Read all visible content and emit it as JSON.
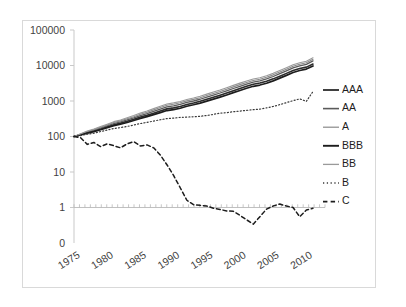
{
  "chart_data": {
    "type": "line",
    "title": "",
    "xlabel": "",
    "ylabel": "",
    "yscale": "log",
    "ylim": [
      0.3,
      100000
    ],
    "xlim": [
      1974,
      2010
    ],
    "grid": false,
    "legend_position": "right",
    "y_tick_labels": [
      "100000",
      "10000",
      "1000",
      "100",
      "10",
      "1",
      "0"
    ],
    "y_tick_values": [
      100000,
      10000,
      1000,
      100,
      10,
      1,
      0
    ],
    "x_tick_labels": [
      "1975",
      "1980",
      "1985",
      "1990",
      "1995",
      "2000",
      "2005",
      "2010"
    ],
    "x_tick_values": [
      1975,
      1980,
      1985,
      1990,
      1995,
      2000,
      2005,
      2010
    ],
    "x": [
      1974,
      1975,
      1976,
      1977,
      1978,
      1979,
      1980,
      1981,
      1982,
      1983,
      1984,
      1985,
      1986,
      1987,
      1988,
      1989,
      1990,
      1991,
      1992,
      1993,
      1994,
      1995,
      1996,
      1997,
      1998,
      1999,
      2000,
      2001,
      2002,
      2003,
      2004,
      2005,
      2006,
      2007,
      2008,
      2009,
      2010
    ],
    "series": [
      {
        "name": "AAA",
        "style": "solid",
        "color": "#2b2b2b",
        "width": 1.6,
        "values": [
          100,
          112,
          128,
          143,
          163,
          188,
          215,
          238,
          268,
          305,
          352,
          398,
          455,
          521,
          600,
          640,
          700,
          800,
          880,
          980,
          1120,
          1280,
          1460,
          1680,
          1950,
          2250,
          2600,
          2950,
          3200,
          3600,
          4200,
          5000,
          6000,
          7200,
          8200,
          9000,
          11000
        ]
      },
      {
        "name": "AA",
        "style": "solid",
        "color": "#5a5a5a",
        "width": 1.3,
        "values": [
          100,
          115,
          133,
          150,
          172,
          200,
          232,
          258,
          292,
          335,
          390,
          442,
          510,
          590,
          680,
          730,
          800,
          910,
          1000,
          1120,
          1280,
          1470,
          1680,
          1940,
          2250,
          2600,
          3000,
          3400,
          3700,
          4200,
          4900,
          5900,
          7100,
          8600,
          9800,
          10800,
          13500
        ]
      },
      {
        "name": "A",
        "style": "solid",
        "color": "#8a8a8a",
        "width": 1.1,
        "values": [
          100,
          118,
          138,
          157,
          182,
          212,
          248,
          276,
          315,
          362,
          424,
          484,
          562,
          652,
          756,
          812,
          890,
          1010,
          1110,
          1240,
          1420,
          1630,
          1860,
          2150,
          2500,
          2890,
          3330,
          3780,
          4100,
          4650,
          5450,
          6550,
          7900,
          9500,
          10900,
          12000,
          15000
        ]
      },
      {
        "name": "BBB",
        "style": "solid",
        "color": "#1d1d1d",
        "width": 1.7,
        "values": [
          100,
          110,
          124,
          137,
          155,
          178,
          202,
          222,
          248,
          282,
          324,
          364,
          414,
          470,
          538,
          574,
          626,
          712,
          782,
          870,
          992,
          1130,
          1288,
          1480,
          1716,
          1980,
          2288,
          2596,
          2816,
          3168,
          3696,
          4400,
          5280,
          6336,
          7216,
          7920,
          9680
        ]
      },
      {
        "name": "BB",
        "style": "solid",
        "color": "#9a9a9a",
        "width": 1.1,
        "values": [
          100,
          120,
          142,
          163,
          190,
          222,
          262,
          292,
          336,
          388,
          456,
          524,
          610,
          710,
          824,
          886,
          972,
          1104,
          1216,
          1360,
          1560,
          1792,
          2048,
          2368,
          2752,
          3184,
          3672,
          4168,
          4520,
          5128,
          6008,
          7216,
          8704,
          10472,
          12008,
          13216,
          16500
        ]
      },
      {
        "name": "B",
        "style": "dotted",
        "color": "#3a3a3a",
        "width": 1.2,
        "values": [
          100,
          106,
          116,
          124,
          138,
          152,
          168,
          178,
          192,
          210,
          232,
          250,
          272,
          296,
          320,
          330,
          345,
          352,
          360,
          372,
          390,
          420,
          455,
          470,
          500,
          520,
          545,
          570,
          590,
          640,
          700,
          790,
          900,
          1020,
          1150,
          980,
          1850
        ]
      },
      {
        "name": "C",
        "style": "dashed",
        "color": "#1d1d1d",
        "width": 1.5,
        "values": [
          100,
          92,
          60,
          68,
          52,
          62,
          55,
          48,
          62,
          72,
          54,
          58,
          48,
          30,
          16,
          8,
          3.6,
          1.6,
          1.2,
          1.15,
          1.1,
          0.95,
          0.88,
          0.8,
          0.78,
          0.6,
          0.45,
          0.34,
          0.55,
          0.9,
          1.1,
          1.25,
          1.1,
          1.0,
          0.55,
          0.85,
          0.95
        ]
      }
    ],
    "legend": [
      {
        "label": "AAA",
        "style": "solid",
        "color": "#2b2b2b",
        "width": 1.8
      },
      {
        "label": "AA",
        "style": "solid",
        "color": "#5a5a5a",
        "width": 1.6
      },
      {
        "label": "A",
        "style": "solid",
        "color": "#8a8a8a",
        "width": 1.2
      },
      {
        "label": "BBB",
        "style": "solid",
        "color": "#1d1d1d",
        "width": 1.9
      },
      {
        "label": "BB",
        "style": "solid",
        "color": "#9a9a9a",
        "width": 1.3
      },
      {
        "label": "B",
        "style": "dotted",
        "color": "#3a3a3a",
        "width": 1.4
      },
      {
        "label": "C",
        "style": "dashed",
        "color": "#1d1d1d",
        "width": 1.7
      }
    ]
  }
}
